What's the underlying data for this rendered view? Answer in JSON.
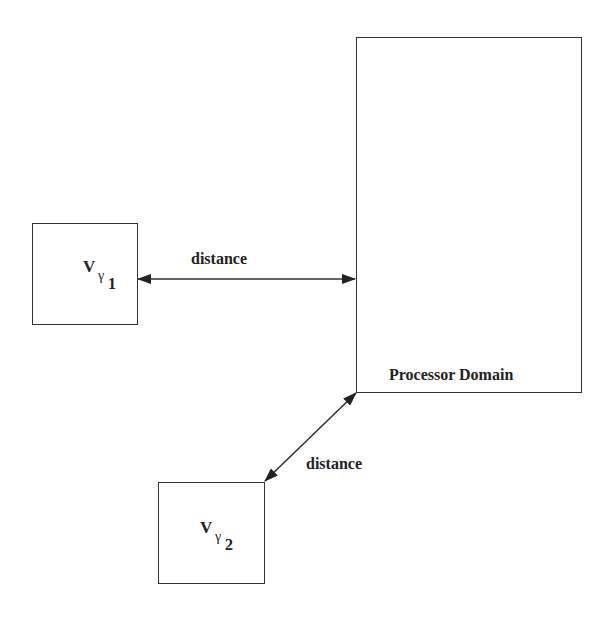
{
  "nodes": {
    "v1": {
      "main": "V",
      "greek": "γ",
      "index": "1"
    },
    "v2": {
      "main": "V",
      "greek": "γ",
      "index": "2"
    },
    "processor": {
      "label": "Processor Domain"
    }
  },
  "edges": {
    "horizontal": {
      "label": "distance"
    },
    "diagonal": {
      "label": "distance"
    }
  },
  "colors": {
    "stroke": "#333333",
    "text": "#222222",
    "background": "#ffffff"
  }
}
